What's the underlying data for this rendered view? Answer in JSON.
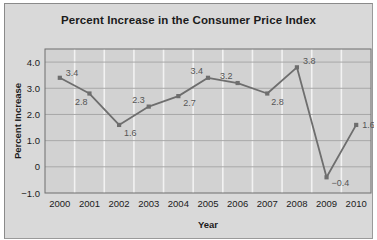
{
  "chart_data": {
    "type": "line",
    "title": "Percent Increase in the Consumer Price Index",
    "xlabel": "Year",
    "ylabel": "Percent Increase",
    "categories": [
      "2000",
      "2001",
      "2002",
      "2003",
      "2004",
      "2005",
      "2006",
      "2007",
      "2008",
      "2009",
      "2010"
    ],
    "values": [
      3.4,
      2.8,
      1.6,
      2.3,
      2.7,
      3.4,
      3.2,
      2.8,
      3.8,
      -0.4,
      1.6
    ],
    "point_labels": [
      "3.4",
      "2.8",
      "1.6",
      "2.3",
      "2.7",
      "3.4",
      "3.2",
      "2.8",
      "3.8",
      "−0.4",
      "1.6"
    ],
    "ylim": [
      -1.0,
      4.5
    ],
    "ytick_values": [
      4.0,
      3.0,
      2.0,
      1.0,
      0,
      -1.0
    ],
    "ytick_labels": [
      "4.0",
      "3.0",
      "2.0",
      "1.0",
      "0",
      "−1.0"
    ],
    "grid": "horizontal-and-vertical",
    "legend": "none",
    "series_name": "Percent Increase",
    "colors": {
      "card_background": "#d9d9d9",
      "plot_background": "#d2d2d2",
      "line": "#6e6e6e",
      "marker": "#6e6e6e",
      "gridline_horizontal": "#a8a8a8",
      "gridline_vertical": "#f2f2f2",
      "axis": "#5a5a5a",
      "text": "#1b1b1b",
      "label_text": "#555555"
    }
  }
}
